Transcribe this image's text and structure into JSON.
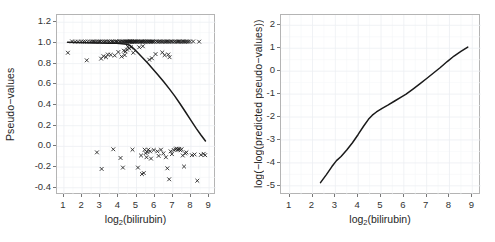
{
  "figure": {
    "panels": [
      "left",
      "right"
    ]
  },
  "chart_data": [
    {
      "panel": "left",
      "type": "scatter",
      "title": "",
      "xlabel": "log2(bilirubin)",
      "xlabel_base": "log",
      "xlabel_sub": "2",
      "xlabel_rest": "(bilirubin)",
      "ylabel": "Pseudo−values",
      "xlim": [
        0.62,
        9.38
      ],
      "ylim": [
        -0.47,
        1.27
      ],
      "xticks": [
        1,
        2,
        3,
        4,
        5,
        6,
        7,
        8,
        9
      ],
      "xticklabels": [
        "1",
        "2",
        "3",
        "4",
        "5",
        "6",
        "7",
        "8",
        "9"
      ],
      "yticks": [
        1.2,
        1.0,
        0.8,
        0.6,
        0.4,
        0.2,
        0.0,
        -0.2,
        -0.4
      ],
      "yticklabels": [
        "1.2",
        "1.0",
        "0.8",
        "0.6",
        "0.4",
        "0.2",
        "0.0",
        "-0.2",
        "-0.4"
      ],
      "grid": true,
      "legend": "none",
      "marker": "x",
      "marker_color": "#1c1c1c",
      "line_color": "#1a1a1a",
      "points": [
        [
          1.22,
          0.905
        ],
        [
          1.45,
          1.015
        ],
        [
          1.62,
          1.012
        ],
        [
          1.78,
          1.013
        ],
        [
          1.95,
          1.014
        ],
        [
          2.08,
          1.012
        ],
        [
          2.18,
          1.013
        ],
        [
          2.26,
          0.832
        ],
        [
          2.32,
          1.014
        ],
        [
          2.45,
          1.012
        ],
        [
          2.55,
          1.013
        ],
        [
          2.62,
          1.014
        ],
        [
          2.7,
          1.012
        ],
        [
          2.78,
          1.013
        ],
        [
          2.82,
          -0.058
        ],
        [
          2.88,
          1.014
        ],
        [
          2.95,
          1.012
        ],
        [
          3.02,
          1.013
        ],
        [
          3.05,
          0.848
        ],
        [
          3.08,
          -0.218
        ],
        [
          3.12,
          1.014
        ],
        [
          3.18,
          0.872
        ],
        [
          3.22,
          1.012
        ],
        [
          3.28,
          1.013
        ],
        [
          3.32,
          0.862
        ],
        [
          3.38,
          1.014
        ],
        [
          3.42,
          0.888
        ],
        [
          3.48,
          1.012
        ],
        [
          3.52,
          1.013
        ],
        [
          3.58,
          0.885
        ],
        [
          3.62,
          1.014
        ],
        [
          3.68,
          1.012
        ],
        [
          3.72,
          -0.028
        ],
        [
          3.75,
          1.013
        ],
        [
          3.8,
          0.878
        ],
        [
          3.85,
          1.014
        ],
        [
          3.9,
          1.012
        ],
        [
          3.95,
          1.013
        ],
        [
          4.0,
          0.912
        ],
        [
          4.05,
          1.014
        ],
        [
          4.1,
          1.012
        ],
        [
          4.12,
          -0.112
        ],
        [
          4.15,
          1.013
        ],
        [
          4.18,
          0.868
        ],
        [
          4.22,
          1.014
        ],
        [
          4.25,
          -0.205
        ],
        [
          4.28,
          1.012
        ],
        [
          4.3,
          0.925
        ],
        [
          4.32,
          1.013
        ],
        [
          4.35,
          0.882
        ],
        [
          4.38,
          1.014
        ],
        [
          4.4,
          0.918
        ],
        [
          4.42,
          1.012
        ],
        [
          4.45,
          1.013
        ],
        [
          4.48,
          0.935
        ],
        [
          4.5,
          1.014
        ],
        [
          4.52,
          0.962
        ],
        [
          4.55,
          1.012
        ],
        [
          4.58,
          1.013
        ],
        [
          4.6,
          0.948
        ],
        [
          4.62,
          1.014
        ],
        [
          4.65,
          1.012
        ],
        [
          4.68,
          1.013
        ],
        [
          4.7,
          0.958
        ],
        [
          4.72,
          1.014
        ],
        [
          4.75,
          1.012
        ],
        [
          4.78,
          -0.032
        ],
        [
          4.8,
          1.013
        ],
        [
          4.82,
          0.905
        ],
        [
          4.85,
          1.014
        ],
        [
          4.88,
          1.012
        ],
        [
          4.92,
          1.013
        ],
        [
          4.95,
          1.014
        ],
        [
          5.0,
          1.012
        ],
        [
          5.05,
          1.013
        ],
        [
          5.08,
          -0.205
        ],
        [
          5.1,
          1.014
        ],
        [
          5.15,
          0.958
        ],
        [
          5.18,
          1.012
        ],
        [
          5.22,
          1.013
        ],
        [
          5.25,
          -0.088
        ],
        [
          5.28,
          1.014
        ],
        [
          5.3,
          -0.268
        ],
        [
          5.32,
          1.012
        ],
        [
          5.35,
          0.968
        ],
        [
          5.38,
          1.013
        ],
        [
          5.4,
          -0.258
        ],
        [
          5.42,
          1.014
        ],
        [
          5.45,
          -0.032
        ],
        [
          5.48,
          1.012
        ],
        [
          5.5,
          -0.065
        ],
        [
          5.52,
          1.013
        ],
        [
          5.55,
          -0.105
        ],
        [
          5.58,
          1.014
        ],
        [
          5.6,
          -0.055
        ],
        [
          5.62,
          1.012
        ],
        [
          5.65,
          -0.032
        ],
        [
          5.68,
          1.013
        ],
        [
          5.7,
          0.838
        ],
        [
          5.72,
          1.014
        ],
        [
          5.75,
          -0.048
        ],
        [
          5.78,
          1.012
        ],
        [
          5.8,
          -0.118
        ],
        [
          5.82,
          1.013
        ],
        [
          5.85,
          0.852
        ],
        [
          5.88,
          1.014
        ],
        [
          5.92,
          1.012
        ],
        [
          5.95,
          -0.035
        ],
        [
          6.0,
          1.013
        ],
        [
          6.05,
          0.892
        ],
        [
          6.1,
          1.014
        ],
        [
          6.15,
          -0.048
        ],
        [
          6.18,
          1.012
        ],
        [
          6.22,
          -0.092
        ],
        [
          6.25,
          1.013
        ],
        [
          6.3,
          1.014
        ],
        [
          6.35,
          -0.032
        ],
        [
          6.38,
          1.012
        ],
        [
          6.42,
          0.908
        ],
        [
          6.45,
          1.013
        ],
        [
          6.48,
          -0.068
        ],
        [
          6.52,
          1.014
        ],
        [
          6.55,
          0.882
        ],
        [
          6.58,
          1.012
        ],
        [
          6.62,
          -0.105
        ],
        [
          6.65,
          1.013
        ],
        [
          6.7,
          -0.212
        ],
        [
          6.72,
          1.014
        ],
        [
          6.75,
          0.888
        ],
        [
          6.78,
          1.012
        ],
        [
          6.8,
          -0.318
        ],
        [
          6.82,
          0.862
        ],
        [
          6.85,
          1.013
        ],
        [
          6.88,
          -0.048
        ],
        [
          6.92,
          1.014
        ],
        [
          6.95,
          -0.075
        ],
        [
          7.0,
          1.012
        ],
        [
          7.05,
          -0.035
        ],
        [
          7.1,
          1.013
        ],
        [
          7.15,
          -0.028
        ],
        [
          7.18,
          1.014
        ],
        [
          7.22,
          -0.022
        ],
        [
          7.25,
          1.012
        ],
        [
          7.28,
          -0.032
        ],
        [
          7.32,
          1.013
        ],
        [
          7.35,
          -0.025
        ],
        [
          7.38,
          1.014
        ],
        [
          7.42,
          -0.038
        ],
        [
          7.45,
          1.012
        ],
        [
          7.48,
          -0.028
        ],
        [
          7.52,
          1.013
        ],
        [
          7.55,
          -0.088
        ],
        [
          7.58,
          1.014
        ],
        [
          7.62,
          -0.195
        ],
        [
          7.65,
          1.012
        ],
        [
          7.68,
          -0.068
        ],
        [
          7.72,
          1.013
        ],
        [
          7.75,
          -0.058
        ],
        [
          7.78,
          1.014
        ],
        [
          7.85,
          1.012
        ],
        [
          7.95,
          1.013
        ],
        [
          8.05,
          -0.085
        ],
        [
          8.12,
          1.014
        ],
        [
          8.2,
          -0.078
        ],
        [
          8.35,
          -0.332
        ],
        [
          8.45,
          1.012
        ],
        [
          8.55,
          -0.082
        ],
        [
          8.7,
          -0.072
        ],
        [
          8.78,
          -0.085
        ]
      ],
      "curve": [
        [
          1.2,
          1.006
        ],
        [
          1.8,
          1.004
        ],
        [
          2.4,
          1.002
        ],
        [
          3.0,
          1.0
        ],
        [
          3.5,
          0.998
        ],
        [
          3.9,
          0.996
        ],
        [
          4.2,
          0.993
        ],
        [
          4.45,
          0.988
        ],
        [
          4.62,
          0.978
        ],
        [
          4.75,
          0.96
        ],
        [
          4.9,
          0.935
        ],
        [
          5.1,
          0.9
        ],
        [
          5.35,
          0.855
        ],
        [
          5.6,
          0.808
        ],
        [
          5.9,
          0.748
        ],
        [
          6.2,
          0.688
        ],
        [
          6.5,
          0.625
        ],
        [
          6.8,
          0.558
        ],
        [
          7.1,
          0.488
        ],
        [
          7.4,
          0.412
        ],
        [
          7.7,
          0.332
        ],
        [
          8.0,
          0.252
        ],
        [
          8.3,
          0.172
        ],
        [
          8.55,
          0.11
        ],
        [
          8.8,
          0.052
        ]
      ]
    },
    {
      "panel": "right",
      "type": "line",
      "title": "",
      "xlabel": "log2(bilirubin)",
      "xlabel_base": "log",
      "xlabel_sub": "2",
      "xlabel_rest": "(bilirubin)",
      "ylabel": "log(−log(predicted pseudo−values))",
      "xlim": [
        0.62,
        9.38
      ],
      "ylim": [
        -5.4,
        2.45
      ],
      "xticks": [
        1,
        2,
        3,
        4,
        5,
        6,
        7,
        8,
        9
      ],
      "xticklabels": [
        "1",
        "2",
        "3",
        "4",
        "5",
        "6",
        "7",
        "8",
        "9"
      ],
      "yticks": [
        2,
        1,
        0,
        -1,
        -2,
        -3,
        -4,
        -5
      ],
      "yticklabels": [
        "2",
        "1",
        "0",
        "-1",
        "-2",
        "-3",
        "-4",
        "-5"
      ],
      "grid": true,
      "legend": "none",
      "line_color": "#1a1a1a",
      "x": [
        2.35,
        2.6,
        2.85,
        3.05,
        3.25,
        3.5,
        3.75,
        4.0,
        4.25,
        4.45,
        4.62,
        4.8,
        5.05,
        5.3,
        5.6,
        5.9,
        6.1,
        6.4,
        6.7,
        7.0,
        7.3,
        7.6,
        7.9,
        8.2,
        8.5,
        8.8
      ],
      "y": [
        -4.86,
        -4.52,
        -4.16,
        -3.9,
        -3.72,
        -3.44,
        -3.12,
        -2.76,
        -2.38,
        -2.1,
        -1.92,
        -1.78,
        -1.62,
        -1.48,
        -1.3,
        -1.12,
        -1.0,
        -0.78,
        -0.55,
        -0.32,
        -0.08,
        0.16,
        0.42,
        0.66,
        0.86,
        1.05
      ]
    }
  ]
}
